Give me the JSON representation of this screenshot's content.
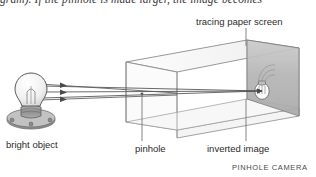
{
  "figure": {
    "width": 316,
    "height": 177,
    "background": "#ffffff",
    "partial_body_text": "gram). If the pinhole is made larger, the image becomes",
    "caption": "PINHOLE CAMERA"
  },
  "labels": {
    "tracing_screen": "tracing paper screen",
    "bright_object": "bright object",
    "pinhole": "pinhole",
    "inverted_image": "inverted image"
  },
  "colors": {
    "ink": "#2b2b2b",
    "line": "#6e6e6e",
    "box_edge": "#8a8a8a",
    "screen_fill": "#b9b9b9",
    "screen_edge": "#7d7d7d",
    "bulb_glass": "#f2f2f2",
    "bulb_outline": "#5a5a5a",
    "base_metal": "#9a9a9a",
    "socket_dark": "#6b6b6b",
    "ray": "#565656",
    "glow": "#9c9c9c"
  },
  "diagram": {
    "type": "optics-ray-diagram",
    "subject": "pinhole camera",
    "elements": [
      "bright object (light bulb on round socket base)",
      "three light rays with arrowheads travelling right",
      "open rectangular box drawn in perspective",
      "pinhole at front face of box",
      "tracing paper screen at far end of box",
      "inverted image of the bulb on the screen"
    ],
    "ray_count": 3
  }
}
